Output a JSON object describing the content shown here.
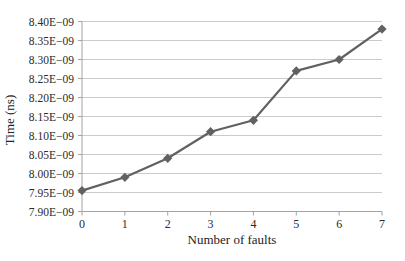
{
  "chart_data": {
    "type": "line",
    "title": "",
    "xlabel": "Number of faults",
    "ylabel": "Time (ns)",
    "x": [
      0,
      1,
      2,
      3,
      4,
      5,
      6,
      7
    ],
    "series": [
      {
        "name": "time-vs-faults",
        "values": [
          7.955e-09,
          7.99e-09,
          8.04e-09,
          8.11e-09,
          8.14e-09,
          8.27e-09,
          8.3e-09,
          8.38e-09
        ],
        "marker": "diamond",
        "color": "#616161"
      }
    ],
    "xlim": [
      0,
      7
    ],
    "ylim": [
      7.9e-09,
      8.4e-09
    ],
    "y_tick_step": 5e-11,
    "y_tick_labels": [
      "7.90E−09",
      "7.95E−09",
      "8.00E−09",
      "8.05E−09",
      "8.10E−09",
      "8.15E−09",
      "8.20E−09",
      "8.25E−09",
      "8.30E−09",
      "8.35E−09",
      "8.40E−09"
    ],
    "x_tick_labels": [
      "0",
      "1",
      "2",
      "3",
      "4",
      "5",
      "6",
      "7"
    ],
    "grid": "horizontal",
    "legend": "none",
    "colors": {
      "line": "#616161",
      "marker": "#616161",
      "grid": "#cbcbcb",
      "axis": "#a3a3a3",
      "text": "#2b2b2b",
      "background": "#ffffff"
    }
  }
}
